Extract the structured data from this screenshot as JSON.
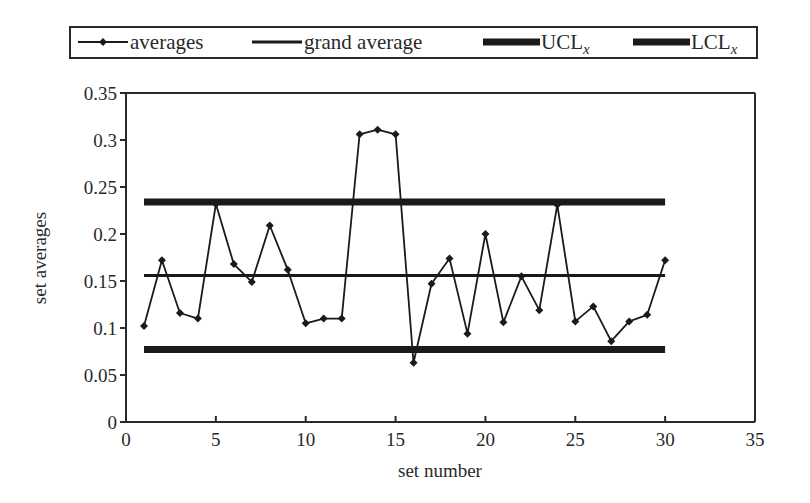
{
  "chart_data": {
    "type": "line",
    "title": "",
    "xlabel": "set number",
    "ylabel": "set averages",
    "xlim": [
      0,
      35
    ],
    "ylim": [
      0,
      0.35
    ],
    "xticks": [
      0,
      5,
      10,
      15,
      20,
      25,
      30,
      35
    ],
    "xtick_labels": [
      "0",
      "5",
      "10",
      "15",
      "20",
      "25",
      "30",
      "35"
    ],
    "yticks": [
      0,
      0.05,
      0.1,
      0.15,
      0.2,
      0.25,
      0.3,
      0.35
    ],
    "ytick_labels": [
      "0",
      "0.05",
      "0.1",
      "0.15",
      "0.2",
      "0.25",
      "0.3",
      "0.35"
    ],
    "grid": false,
    "legend_position": "top",
    "legend": [
      {
        "label": "averages",
        "style": "line-marker"
      },
      {
        "label": "grand average",
        "style": "line"
      },
      {
        "label": "UCL",
        "subscript": "x",
        "style": "thick-line"
      },
      {
        "label": "LCL",
        "subscript": "x",
        "style": "thick-line"
      }
    ],
    "series": [
      {
        "name": "averages",
        "x": [
          1,
          2,
          3,
          4,
          5,
          6,
          7,
          8,
          9,
          10,
          11,
          12,
          13,
          14,
          15,
          16,
          17,
          18,
          19,
          20,
          21,
          22,
          23,
          24,
          25,
          26,
          27,
          28,
          29,
          30
        ],
        "values": [
          0.102,
          0.172,
          0.116,
          0.11,
          0.232,
          0.168,
          0.149,
          0.209,
          0.162,
          0.105,
          0.11,
          0.11,
          0.306,
          0.311,
          0.306,
          0.063,
          0.147,
          0.174,
          0.094,
          0.2,
          0.106,
          0.155,
          0.119,
          0.231,
          0.107,
          0.123,
          0.086,
          0.107,
          0.114,
          0.172
        ],
        "color": "#1a1a1a",
        "marker": "diamond"
      },
      {
        "name": "grand average",
        "x": [
          1,
          30
        ],
        "values": [
          0.156,
          0.156
        ],
        "color": "#1a1a1a",
        "width": 3
      },
      {
        "name": "UCL_x",
        "x": [
          1,
          30
        ],
        "values": [
          0.234,
          0.234
        ],
        "color": "#1a1a1a",
        "width": 7
      },
      {
        "name": "LCL_x",
        "x": [
          1,
          30
        ],
        "values": [
          0.077,
          0.077
        ],
        "color": "#1a1a1a",
        "width": 7
      }
    ]
  }
}
